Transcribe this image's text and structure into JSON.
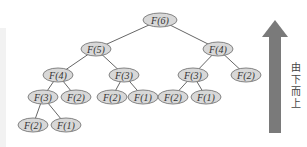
{
  "diagram": {
    "node_fill": "#d8d8d8",
    "node_stroke": "#777777",
    "edge_color": "#555555",
    "arrow_color": "#7a7a7a",
    "nodes": [
      {
        "id": "n0",
        "label": "F(6)",
        "cx": 160,
        "cy": 20,
        "rx": 17,
        "ry": 7
      },
      {
        "id": "n1",
        "label": "F(5)",
        "cx": 96,
        "cy": 49,
        "rx": 15,
        "ry": 7
      },
      {
        "id": "n2",
        "label": "F(4)",
        "cx": 218,
        "cy": 49,
        "rx": 15,
        "ry": 7
      },
      {
        "id": "n3",
        "label": "F(4)",
        "cx": 58,
        "cy": 75,
        "rx": 15,
        "ry": 7
      },
      {
        "id": "n4",
        "label": "F(3)",
        "cx": 124,
        "cy": 75,
        "rx": 15,
        "ry": 7
      },
      {
        "id": "n5",
        "label": "F(3)",
        "cx": 193,
        "cy": 75,
        "rx": 15,
        "ry": 7
      },
      {
        "id": "n6",
        "label": "F(2)",
        "cx": 246,
        "cy": 75,
        "rx": 15,
        "ry": 7
      },
      {
        "id": "n7",
        "label": "F(3)",
        "cx": 43,
        "cy": 97,
        "rx": 15,
        "ry": 7
      },
      {
        "id": "n8",
        "label": "F(2)",
        "cx": 76,
        "cy": 97,
        "rx": 15,
        "ry": 7
      },
      {
        "id": "n9",
        "label": "F(2)",
        "cx": 112,
        "cy": 97,
        "rx": 15,
        "ry": 7
      },
      {
        "id": "n10",
        "label": "F(1)",
        "cx": 143,
        "cy": 97,
        "rx": 15,
        "ry": 7
      },
      {
        "id": "n11",
        "label": "F(2)",
        "cx": 173,
        "cy": 97,
        "rx": 15,
        "ry": 7
      },
      {
        "id": "n12",
        "label": "F(1)",
        "cx": 206,
        "cy": 97,
        "rx": 15,
        "ry": 7
      },
      {
        "id": "n13",
        "label": "F(2)",
        "cx": 33,
        "cy": 125,
        "rx": 15,
        "ry": 7
      },
      {
        "id": "n14",
        "label": "F(1)",
        "cx": 66,
        "cy": 125,
        "rx": 15,
        "ry": 7
      }
    ],
    "edges": [
      [
        "n0",
        "n1"
      ],
      [
        "n0",
        "n2"
      ],
      [
        "n1",
        "n3"
      ],
      [
        "n1",
        "n4"
      ],
      [
        "n2",
        "n5"
      ],
      [
        "n2",
        "n6"
      ],
      [
        "n3",
        "n7"
      ],
      [
        "n3",
        "n8"
      ],
      [
        "n4",
        "n9"
      ],
      [
        "n4",
        "n10"
      ],
      [
        "n5",
        "n11"
      ],
      [
        "n5",
        "n12"
      ],
      [
        "n7",
        "n13"
      ],
      [
        "n7",
        "n14"
      ]
    ],
    "direction_label": [
      "由",
      "下",
      "而",
      "上"
    ]
  }
}
